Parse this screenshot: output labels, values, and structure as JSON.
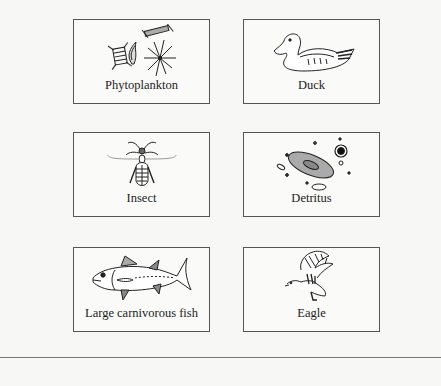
{
  "organisms": [
    {
      "label": "Phytoplankton",
      "icon": "phytoplankton-icon"
    },
    {
      "label": "Duck",
      "icon": "duck-icon"
    },
    {
      "label": "Insect",
      "icon": "insect-icon"
    },
    {
      "label": "Detritus",
      "icon": "detritus-icon"
    },
    {
      "label": "Large carnivorous fish",
      "icon": "fish-icon"
    },
    {
      "label": "Eagle",
      "icon": "eagle-icon"
    }
  ],
  "colors": {
    "border": "#555555",
    "background": "#f7f7f5",
    "fill_gray": "#aaaaaa",
    "ink": "#222222"
  }
}
